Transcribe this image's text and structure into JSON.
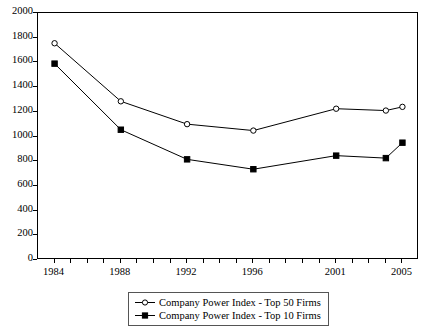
{
  "chart_data": {
    "type": "line",
    "title": "",
    "xlabel": "",
    "ylabel": "",
    "x": [
      1984,
      1988,
      1992,
      1996,
      2001,
      2004,
      2005
    ],
    "xtick_labels": [
      "1984",
      "1988",
      "1992",
      "1996",
      "2001",
      "2005"
    ],
    "xtick_values": [
      1984,
      1988,
      1992,
      1996,
      2001,
      2005
    ],
    "ytick_labels": [
      "0",
      "200",
      "400",
      "600",
      "800",
      "1000",
      "1200",
      "1400",
      "1600",
      "1800",
      "2000"
    ],
    "ytick_values": [
      0,
      200,
      400,
      600,
      800,
      1000,
      1200,
      1400,
      1600,
      1800,
      2000
    ],
    "ylim": [
      0,
      2000
    ],
    "xlim": [
      1983,
      2006
    ],
    "grid": false,
    "legend_position": "below-center",
    "series": [
      {
        "name": "Company Power Index - Top 50 Firms",
        "marker": "open-circle",
        "color": "#000000",
        "values": [
          1755,
          1285,
          1100,
          1048,
          1225,
          1210,
          1240
        ]
      },
      {
        "name": "Company Power Index - Top 10 Firms",
        "marker": "filled-square",
        "color": "#000000",
        "values": [
          1590,
          1055,
          815,
          735,
          845,
          825,
          950
        ]
      }
    ]
  },
  "legend": {
    "entries": [
      {
        "label": "Company Power Index - Top 50 Firms"
      },
      {
        "label": "Company Power Index - Top 10 Firms"
      }
    ]
  }
}
